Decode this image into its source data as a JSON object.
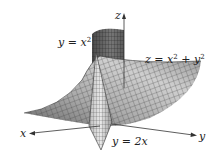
{
  "figure": {
    "surfaces": [
      {
        "name": "paraboloid",
        "equation_lhs": "z = x",
        "equation_mid": " + y",
        "label_full": "z = x² + y²"
      },
      {
        "name": "parabolic-cylinder",
        "equation": "y = x",
        "label_full": "y = x²"
      },
      {
        "name": "plane",
        "equation": "y = 2x",
        "label_full": "y = 2x"
      }
    ],
    "axes": {
      "x": "x",
      "y": "y",
      "z": "z"
    },
    "exponent": "2",
    "colors": {
      "surface_light": "#d8d8d8",
      "surface_mid": "#a8a8a8",
      "surface_dark": "#555555",
      "grid_line": "#333333",
      "axis": "#333333",
      "background": "#ffffff"
    }
  }
}
